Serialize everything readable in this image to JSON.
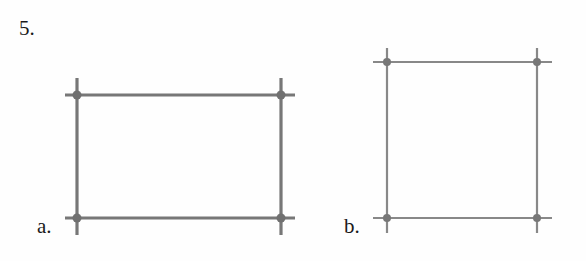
{
  "problem": {
    "number_label": "5."
  },
  "figures": [
    {
      "id": "a",
      "label": "a.",
      "shape": "rectangle",
      "line_color": "#777777",
      "dot_color": "#707070",
      "line_width": 3.2,
      "dot_radius": 4.5,
      "corners": {
        "left": 77,
        "right": 281,
        "top": 95,
        "bottom": 218
      },
      "h_extent": [
        65,
        295
      ],
      "v_extent": [
        78,
        235
      ]
    },
    {
      "id": "b",
      "label": "b.",
      "shape": "square",
      "line_color": "#888888",
      "dot_color": "#777777",
      "line_width": 2.2,
      "dot_radius": 4,
      "corners": {
        "left": 387,
        "right": 537,
        "top": 62,
        "bottom": 218
      },
      "h_extent": [
        373,
        552
      ],
      "v_extent": [
        48,
        233
      ]
    }
  ]
}
